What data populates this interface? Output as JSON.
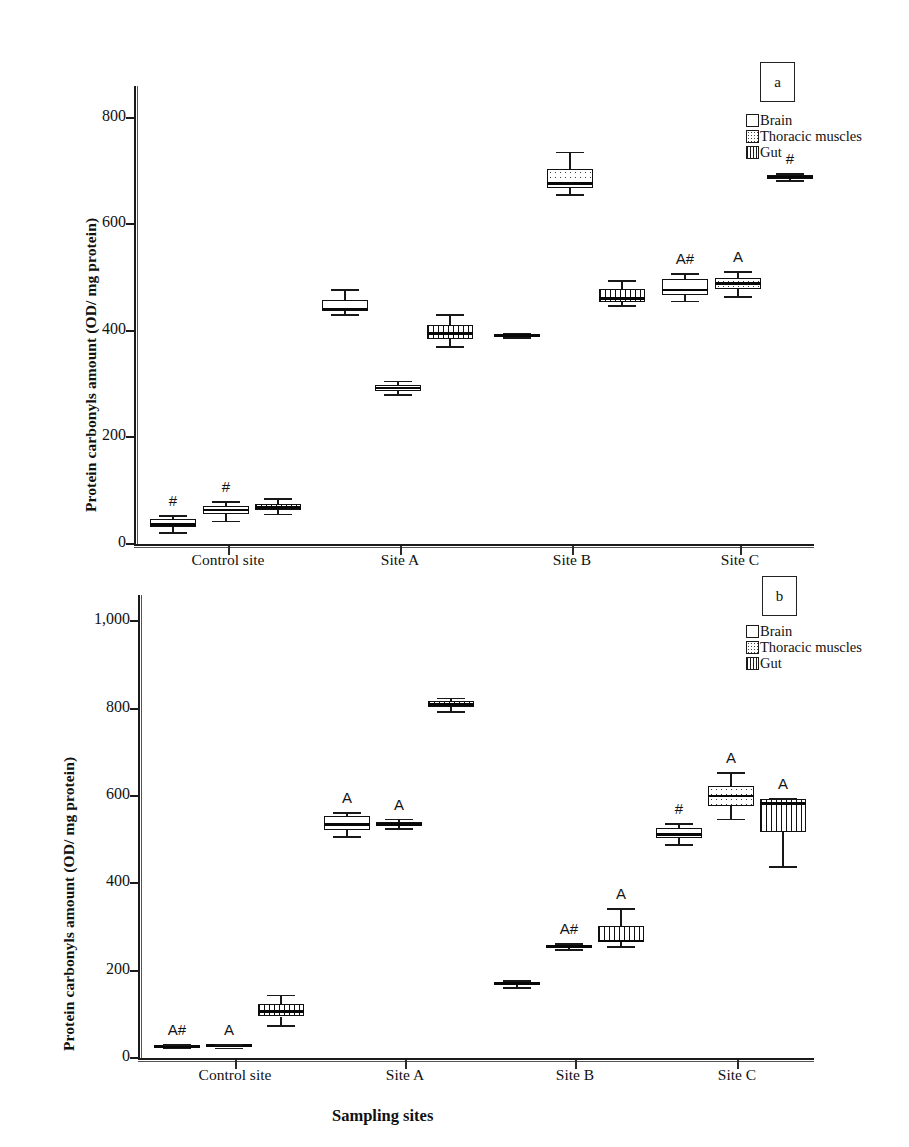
{
  "figure": {
    "ylabel": "Protein carbonyls amount (OD/ mg protein)",
    "xlabel": "Sampling sites"
  },
  "legend": {
    "brain": "Brain",
    "thoracic": "Thoracic muscles",
    "gut": "Gut"
  },
  "panels": {
    "a_tag": "a",
    "b_tag": "b"
  },
  "chart_data": [
    {
      "type": "box",
      "panel": "a",
      "title": "",
      "xlabel": "",
      "ylabel": "Protein carbonyls amount (OD/ mg protein)",
      "categories": [
        "Control site",
        "Site A",
        "Site B",
        "Site C"
      ],
      "ytick_labels": [
        "0",
        "200",
        "400",
        "600",
        "800"
      ],
      "yticks": [
        0,
        200,
        400,
        600,
        800
      ],
      "ylim": [
        0,
        860
      ],
      "grid": false,
      "legend_position": "top-right",
      "series": [
        {
          "name": "Brain",
          "fill": "empty",
          "boxes": [
            {
              "category": "Control site",
              "min": 22,
              "q1": 31,
              "median": 37,
              "q3": 47,
              "max": 55,
              "annotation": "#"
            },
            {
              "category": "Site A",
              "min": 432,
              "q1": 437,
              "median": 441,
              "q3": 458,
              "max": 478,
              "annotation": ""
            },
            {
              "category": "Site B",
              "min": 388,
              "q1": 390,
              "median": 392,
              "q3": 395,
              "max": 397,
              "annotation": ""
            },
            {
              "category": "Site C",
              "min": 457,
              "q1": 468,
              "median": 477,
              "q3": 498,
              "max": 508,
              "annotation": "A#"
            }
          ]
        },
        {
          "name": "Thoracic muscles",
          "fill": "dotted",
          "boxes": [
            {
              "category": "Control site",
              "min": 44,
              "q1": 57,
              "median": 64,
              "q3": 72,
              "max": 80,
              "annotation": "#"
            },
            {
              "category": "Site A",
              "min": 281,
              "q1": 288,
              "median": 293,
              "q3": 299,
              "max": 307,
              "annotation": ""
            },
            {
              "category": "Site B",
              "min": 657,
              "q1": 668,
              "median": 677,
              "q3": 705,
              "max": 737,
              "annotation": ""
            },
            {
              "category": "Site C",
              "min": 465,
              "q1": 478,
              "median": 489,
              "q3": 500,
              "max": 512,
              "annotation": "A"
            }
          ]
        },
        {
          "name": "Gut",
          "fill": "vertical-hatch",
          "boxes": [
            {
              "category": "Control site",
              "min": 57,
              "q1": 63,
              "median": 69,
              "q3": 76,
              "max": 86,
              "annotation": ""
            },
            {
              "category": "Site A",
              "min": 371,
              "q1": 384,
              "median": 395,
              "q3": 412,
              "max": 432,
              "annotation": ""
            },
            {
              "category": "Site B",
              "min": 449,
              "q1": 455,
              "median": 461,
              "q3": 478,
              "max": 495,
              "annotation": ""
            },
            {
              "category": "Site C",
              "min": 683,
              "q1": 686,
              "median": 689,
              "q3": 693,
              "max": 697,
              "annotation": "#"
            }
          ]
        }
      ]
    },
    {
      "type": "box",
      "panel": "b",
      "title": "",
      "xlabel": "Sampling sites",
      "ylabel": "Protein carbonyls amount (OD/ mg protein)",
      "categories": [
        "Control site",
        "Site A",
        "Site B",
        "Site C"
      ],
      "ytick_labels": [
        "0",
        "200",
        "400",
        "600",
        "800",
        "1,000"
      ],
      "yticks": [
        0,
        200,
        400,
        600,
        800,
        1000
      ],
      "ylim": [
        0,
        1060
      ],
      "grid": false,
      "legend_position": "top-right",
      "series": [
        {
          "name": "Brain",
          "fill": "empty",
          "boxes": [
            {
              "category": "Control site",
              "min": 24,
              "q1": 26,
              "median": 27,
              "q3": 29,
              "max": 31,
              "annotation": "A#"
            },
            {
              "category": "Site A",
              "min": 508,
              "q1": 523,
              "median": 535,
              "q3": 553,
              "max": 563,
              "annotation": "A"
            },
            {
              "category": "Site B",
              "min": 162,
              "q1": 167,
              "median": 170,
              "q3": 174,
              "max": 179,
              "annotation": ""
            },
            {
              "category": "Site C",
              "min": 490,
              "q1": 503,
              "median": 512,
              "q3": 526,
              "max": 537,
              "annotation": "#"
            }
          ]
        },
        {
          "name": "Thoracic muscles",
          "fill": "dotted",
          "boxes": [
            {
              "category": "Control site",
              "min": 24,
              "q1": 26,
              "median": 28,
              "q3": 30,
              "max": 32,
              "annotation": "A"
            },
            {
              "category": "Site A",
              "min": 527,
              "q1": 531,
              "median": 535,
              "q3": 541,
              "max": 548,
              "annotation": "A"
            },
            {
              "category": "Site B",
              "min": 249,
              "q1": 252,
              "median": 255,
              "q3": 259,
              "max": 263,
              "annotation": "A#"
            },
            {
              "category": "Site C",
              "min": 548,
              "q1": 578,
              "median": 600,
              "q3": 623,
              "max": 654,
              "annotation": "A"
            }
          ]
        },
        {
          "name": "Gut",
          "fill": "vertical-hatch",
          "boxes": [
            {
              "category": "Control site",
              "min": 76,
              "q1": 95,
              "median": 107,
              "q3": 124,
              "max": 145,
              "annotation": ""
            },
            {
              "category": "Site A",
              "min": 795,
              "q1": 803,
              "median": 809,
              "q3": 817,
              "max": 825,
              "annotation": ""
            },
            {
              "category": "Site B",
              "min": 257,
              "q1": 265,
              "median": 268,
              "q3": 303,
              "max": 344,
              "annotation": "A"
            },
            {
              "category": "Site C",
              "min": 440,
              "q1": 518,
              "median": 582,
              "q3": 592,
              "max": 595,
              "annotation": "A"
            }
          ]
        }
      ]
    }
  ]
}
